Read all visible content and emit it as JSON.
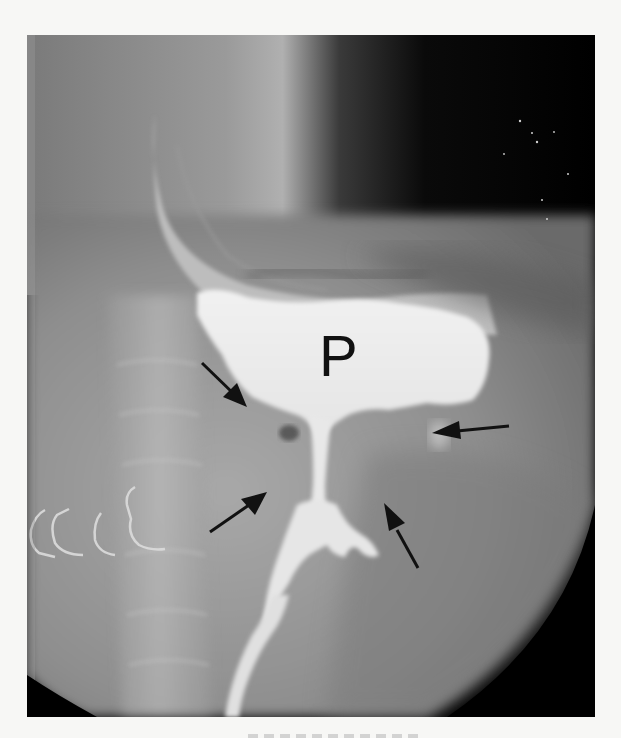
{
  "figure": {
    "type": "radiograph",
    "modality": "barium contrast X-ray",
    "colors": {
      "background_page": "#f7f7f5",
      "film_dark": "#000000",
      "soft_tissue": "#8a8a8a",
      "contrast_fill": "#eeeeee",
      "arrow": "#111111",
      "label": "#111111"
    },
    "labels": [
      {
        "id": "pouch",
        "text": "P"
      }
    ],
    "arrows": [
      {
        "id": "arrow-upper-left",
        "direction": "down-right"
      },
      {
        "id": "arrow-right",
        "direction": "left"
      },
      {
        "id": "arrow-lower-left",
        "direction": "up-right"
      },
      {
        "id": "arrow-lower-right",
        "direction": "up-left"
      }
    ]
  }
}
